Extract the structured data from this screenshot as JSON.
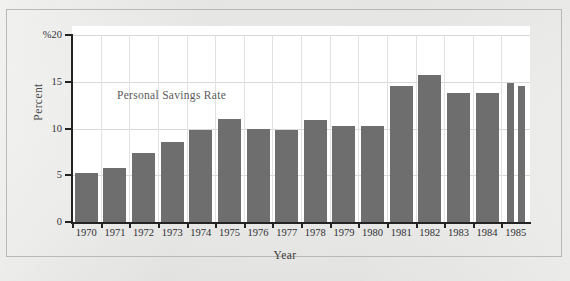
{
  "figure": {
    "series_label": "Personal Savings Rate",
    "x_axis_title": "Year",
    "y_axis_title": "Percent",
    "bar_color": "#6e6e6e",
    "plot_background": "#ffffff",
    "page_background": "#e8e8e6",
    "frame_border_color": "#b9b9b6"
  },
  "chart_data": {
    "type": "bar",
    "title": "Personal Savings Rate",
    "xlabel": "Year",
    "ylabel": "Percent",
    "ylim": [
      0,
      20
    ],
    "yticks": [
      0,
      5,
      10,
      15,
      20
    ],
    "ytick_labels": [
      "0",
      "5",
      "10",
      "15",
      "%20"
    ],
    "grid": true,
    "legend": "none",
    "categories": [
      "1970",
      "1971",
      "1972",
      "1973",
      "1974",
      "1975",
      "1976",
      "1977",
      "1978",
      "1979",
      "1980",
      "1981",
      "1982",
      "1983",
      "1984",
      "1985"
    ],
    "values": [
      5.2,
      5.8,
      7.4,
      8.6,
      9.8,
      11.0,
      10.0,
      9.8,
      10.9,
      10.3,
      10.3,
      14.6,
      15.7,
      13.8,
      13.8,
      14.9
    ],
    "extra_bars": [
      {
        "after_category": "1985",
        "value": 14.5,
        "note": "second narrow bar at right edge"
      }
    ]
  }
}
